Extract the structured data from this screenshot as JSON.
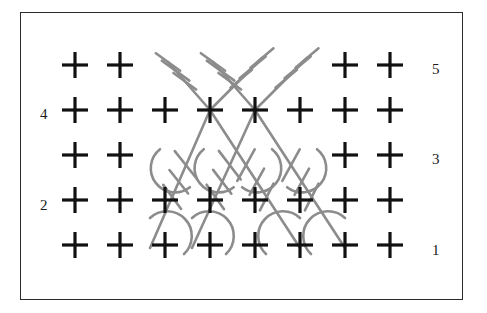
{
  "figure": {
    "kind": "crochet-stitch-chart",
    "background_color": "#ffffff",
    "border_color": "#2b2b2b",
    "grid": {
      "columns": 8,
      "rows": 5,
      "col_step": 45,
      "row_step": 45,
      "origin_x": 75,
      "origin_y": 245
    }
  },
  "symbols": {
    "single_crochet": {
      "name": "single-crochet-cross",
      "glyph": "+",
      "color": "#111111",
      "arm": 13,
      "stroke": 3.2
    },
    "crossed_treble": {
      "name": "crossed-treble-diagonal",
      "color": "#8c8c8c",
      "stroke": 2.6
    }
  },
  "row_labels": {
    "right": [
      {
        "text": "5",
        "x": 432,
        "y": 62
      },
      {
        "text": "3",
        "x": 432,
        "y": 152
      },
      {
        "text": "1",
        "x": 432,
        "y": 243
      }
    ],
    "left": [
      {
        "text": "4",
        "x": 40,
        "y": 107
      },
      {
        "text": "2",
        "x": 40,
        "y": 198
      }
    ]
  },
  "chart_data": {
    "type": "table",
    "title": "",
    "xlabel": "",
    "ylabel": "",
    "legend": [],
    "categories": [
      "col1",
      "col2",
      "col3",
      "col4",
      "col5",
      "col6",
      "col7",
      "col8"
    ],
    "row_names": [
      "1",
      "2",
      "3",
      "4",
      "5"
    ],
    "rows": [
      {
        "row": 1,
        "label": "1",
        "label_side": "right",
        "y": 245,
        "cells": [
          "sc",
          "sc",
          "sc",
          "sc",
          "sc",
          "sc",
          "sc",
          "sc"
        ]
      },
      {
        "row": 2,
        "label": "2",
        "label_side": "left",
        "y": 200,
        "cells": [
          "sc",
          "sc",
          "sc",
          "sc",
          "sc",
          "sc",
          "sc",
          "sc"
        ]
      },
      {
        "row": 3,
        "label": "3",
        "label_side": "right",
        "y": 155,
        "cells": [
          "sc",
          "sc",
          "tr",
          "tr",
          "tr",
          "tr",
          "sc",
          "sc"
        ]
      },
      {
        "row": 4,
        "label": "4",
        "label_side": "left",
        "y": 110,
        "cells": [
          "sc",
          "sc",
          "sc",
          "sc",
          "sc",
          "sc",
          "sc",
          "sc"
        ]
      },
      {
        "row": 5,
        "label": "5",
        "label_side": "right",
        "y": 65,
        "cells": [
          "sc",
          "sc",
          "tr",
          "tr",
          "tr",
          "tr",
          "sc",
          "sc"
        ]
      }
    ],
    "crosses_black": [
      {
        "x": 75,
        "y": 65
      },
      {
        "x": 120,
        "y": 65
      },
      {
        "x": 345,
        "y": 65
      },
      {
        "x": 390,
        "y": 65
      },
      {
        "x": 75,
        "y": 110
      },
      {
        "x": 120,
        "y": 110
      },
      {
        "x": 165,
        "y": 110
      },
      {
        "x": 210,
        "y": 110
      },
      {
        "x": 255,
        "y": 110
      },
      {
        "x": 300,
        "y": 110
      },
      {
        "x": 345,
        "y": 110
      },
      {
        "x": 390,
        "y": 110
      },
      {
        "x": 75,
        "y": 155
      },
      {
        "x": 120,
        "y": 155
      },
      {
        "x": 345,
        "y": 155
      },
      {
        "x": 390,
        "y": 155
      },
      {
        "x": 75,
        "y": 200
      },
      {
        "x": 120,
        "y": 200
      },
      {
        "x": 165,
        "y": 200
      },
      {
        "x": 210,
        "y": 200
      },
      {
        "x": 255,
        "y": 200
      },
      {
        "x": 300,
        "y": 200
      },
      {
        "x": 345,
        "y": 200
      },
      {
        "x": 390,
        "y": 200
      },
      {
        "x": 75,
        "y": 245
      },
      {
        "x": 120,
        "y": 245
      },
      {
        "x": 165,
        "y": 245
      },
      {
        "x": 210,
        "y": 245
      },
      {
        "x": 255,
        "y": 245
      },
      {
        "x": 300,
        "y": 245
      },
      {
        "x": 345,
        "y": 245
      },
      {
        "x": 390,
        "y": 245
      }
    ],
    "treble_upper": [
      {
        "id": "t5a",
        "x1": 210,
        "y1": 110,
        "x2": 168,
        "y2": 62,
        "bar_angle": 36
      },
      {
        "id": "t5b",
        "x1": 255,
        "y1": 110,
        "x2": 213,
        "y2": 62,
        "bar_angle": 36
      },
      {
        "id": "t5c",
        "x1": 210,
        "y1": 110,
        "x2": 262,
        "y2": 58,
        "bar_angle": -40
      },
      {
        "id": "t5d",
        "x1": 255,
        "y1": 110,
        "x2": 307,
        "y2": 58,
        "bar_angle": -40
      }
    ],
    "treble_lower": [
      {
        "id": "t3a",
        "x1": 210,
        "y1": 110,
        "x2": 150,
        "y2": 248,
        "arc": true
      },
      {
        "id": "t3b",
        "x1": 255,
        "y1": 110,
        "x2": 192,
        "y2": 248,
        "arc": true
      },
      {
        "id": "t3c",
        "x1": 210,
        "y1": 110,
        "x2": 300,
        "y2": 248,
        "arc": true
      },
      {
        "id": "t3d",
        "x1": 255,
        "y1": 110,
        "x2": 345,
        "y2": 248,
        "arc": true
      }
    ]
  }
}
